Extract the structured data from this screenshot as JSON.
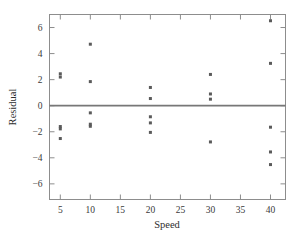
{
  "chart_data": {
    "type": "scatter",
    "title": "",
    "xlabel": "Speed",
    "ylabel": "Residual",
    "xlim": [
      3.2,
      42.5
    ],
    "ylim": [
      -7.2,
      7.0
    ],
    "xticks": [
      5,
      10,
      15,
      20,
      25,
      30,
      35,
      40
    ],
    "xticklabels": [
      "5",
      "10",
      "15",
      "20",
      "25",
      "30",
      "35",
      "40"
    ],
    "yticks": [
      6,
      4,
      2,
      0,
      -2,
      -4,
      -6
    ],
    "yticklabels": [
      "6",
      "4",
      "2",
      "0",
      "−2",
      "−4",
      "−6"
    ],
    "grid": false,
    "legend": null,
    "reference_line": {
      "type": "horizontal",
      "y": 0,
      "color": "#777777"
    },
    "marker": {
      "shape": "square",
      "size": 3,
      "color": "#5a5a5a"
    },
    "points": [
      {
        "x": 5,
        "y": 2.45
      },
      {
        "x": 5,
        "y": 2.2
      },
      {
        "x": 5,
        "y": -1.6
      },
      {
        "x": 5,
        "y": -1.78
      },
      {
        "x": 5,
        "y": -2.52
      },
      {
        "x": 10,
        "y": 4.72
      },
      {
        "x": 10,
        "y": 1.85
      },
      {
        "x": 10,
        "y": -0.55
      },
      {
        "x": 10,
        "y": -1.42
      },
      {
        "x": 10,
        "y": -1.58
      },
      {
        "x": 20,
        "y": 1.4
      },
      {
        "x": 20,
        "y": 0.55
      },
      {
        "x": 20,
        "y": -0.85
      },
      {
        "x": 20,
        "y": -1.32
      },
      {
        "x": 20,
        "y": -2.05
      },
      {
        "x": 30,
        "y": 2.4
      },
      {
        "x": 30,
        "y": 0.9
      },
      {
        "x": 30,
        "y": 0.5
      },
      {
        "x": 30,
        "y": -2.78
      },
      {
        "x": 40,
        "y": 6.52
      },
      {
        "x": 40,
        "y": 3.25
      },
      {
        "x": 40,
        "y": -1.65
      },
      {
        "x": 40,
        "y": -3.55
      },
      {
        "x": 40,
        "y": -4.52
      }
    ],
    "series": [
      {
        "name": "residuals",
        "x": [
          5,
          5,
          5,
          5,
          5,
          10,
          10,
          10,
          10,
          10,
          20,
          20,
          20,
          20,
          20,
          30,
          30,
          30,
          30,
          40,
          40,
          40,
          40,
          40
        ],
        "values": [
          2.45,
          2.2,
          -1.6,
          -1.78,
          -2.52,
          4.72,
          1.85,
          -0.55,
          -1.42,
          -1.58,
          1.4,
          0.55,
          -0.85,
          -1.32,
          -2.05,
          2.4,
          0.9,
          0.5,
          -2.78,
          6.52,
          3.25,
          -1.65,
          -3.55,
          -4.52
        ]
      }
    ]
  },
  "colors": {
    "background": "#ffffff",
    "frame": "#8d8d8d",
    "marker": "#5a5a5a",
    "zero_line": "#777777",
    "text": "#3a3a3a"
  }
}
